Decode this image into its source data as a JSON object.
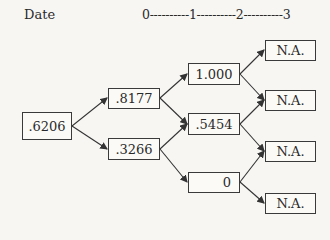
{
  "header": {
    "date_label": "Date",
    "timeline": "0----------1----------2----------3"
  },
  "tree": {
    "date0": [
      {
        "value": ".6206"
      }
    ],
    "date1": [
      {
        "value": ".8177"
      },
      {
        "value": ".3266"
      }
    ],
    "date2": [
      {
        "value": "1.000"
      },
      {
        "value": ".5454"
      },
      {
        "value": "0"
      }
    ],
    "date3": [
      {
        "value": "N.A."
      },
      {
        "value": "N.A."
      },
      {
        "value": "N.A."
      },
      {
        "value": "N.A."
      }
    ]
  }
}
